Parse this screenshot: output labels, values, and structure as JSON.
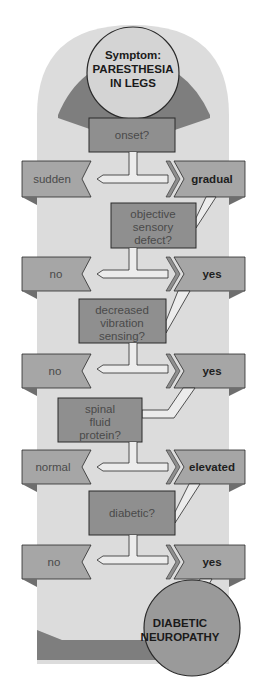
{
  "diagram": {
    "type": "diagnostic-flowchart",
    "start": {
      "line1": "Symptom:",
      "line2": "PARESTHESIA",
      "line3": "IN LEGS"
    },
    "steps": [
      {
        "question": [
          "onset?"
        ],
        "left_answer": "sudden",
        "right_answer": "gradual"
      },
      {
        "question": [
          "objective",
          "sensory",
          "defect?"
        ],
        "left_answer": "no",
        "right_answer": "yes"
      },
      {
        "question": [
          "decreased",
          "vibration",
          "sensing?"
        ],
        "left_answer": "no",
        "right_answer": "yes"
      },
      {
        "question": [
          "spinal",
          "fluid",
          "protein?"
        ],
        "left_answer": "normal",
        "right_answer": "elevated"
      },
      {
        "question": [
          "diabetic?"
        ],
        "left_answer": "no",
        "right_answer": "yes"
      }
    ],
    "conclusion": {
      "line1": "DIABETIC",
      "line2": "NEUROPATHY"
    },
    "colors": {
      "page_bg": "#ffffff",
      "column_bg": "#dcdcdc",
      "dark_band": "#7e7e7e",
      "question_box": "#8f8f8f",
      "answer_tab": "#a6a6a6",
      "tab_fold": "#6e6e6e",
      "connector": "#ececec",
      "circle_start": "#d4d4d4",
      "circle_end": "#9a9a9a",
      "outline": "#2a2a2a"
    }
  }
}
